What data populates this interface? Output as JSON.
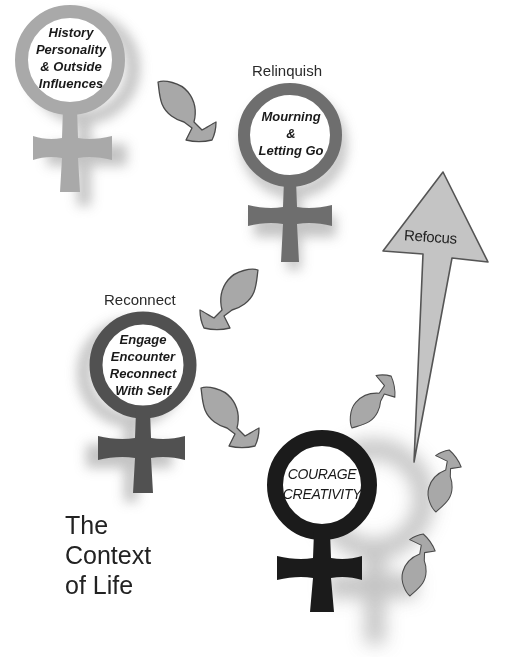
{
  "diagram": {
    "title_lines": [
      "The",
      "Context",
      "of Life"
    ],
    "stages": [
      {
        "id": "history",
        "label": "",
        "inner_lines": [
          "History",
          "Personality",
          "& Outside",
          "Influences"
        ],
        "color": "#a9a9a9"
      },
      {
        "id": "relinquish",
        "label": "Relinquish",
        "inner_lines": [
          "Mourning",
          "&",
          "Letting Go"
        ],
        "color": "#6e6e6e"
      },
      {
        "id": "reconnect",
        "label": "Reconnect",
        "inner_lines": [
          "Engage",
          "Encounter",
          "Reconnect",
          "With Self"
        ],
        "color": "#515151"
      },
      {
        "id": "courage",
        "label": "",
        "inner_lines": [
          "COURAGE",
          "CREATIVITY"
        ],
        "color": "#1b1b1b"
      }
    ],
    "refocus_arrow": {
      "label": "Refocus",
      "fill": "#c4c4c4",
      "stroke": "#555555"
    },
    "leaf_arrows": {
      "fill": "#a8a8a8",
      "stroke": "#4a4a4a",
      "count": 6
    },
    "shadow_color": "#bdbdbd"
  }
}
